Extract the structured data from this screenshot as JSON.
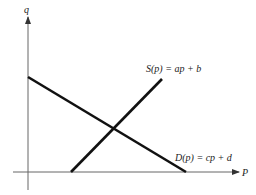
{
  "diagram": {
    "type": "supply-demand",
    "axes": {
      "x_label": "P",
      "y_label": "q"
    },
    "lines": [
      {
        "name": "supply",
        "label": "S(p) = ap + b"
      },
      {
        "name": "demand",
        "label": "D(p) = cp + d"
      }
    ],
    "colors": {
      "axis": "#555555",
      "line": "#111111",
      "background": "#ffffff"
    }
  }
}
